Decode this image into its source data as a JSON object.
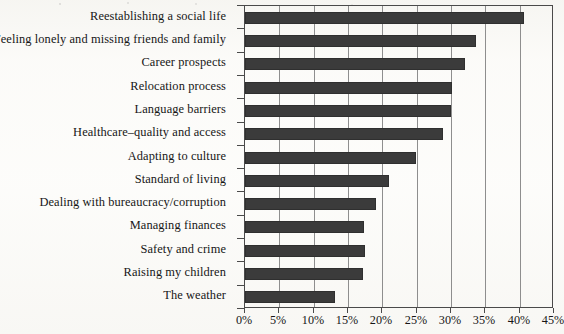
{
  "chart_data": {
    "type": "bar",
    "orientation": "horizontal",
    "title": "",
    "subtitle": "",
    "xlabel": "",
    "ylabel": "",
    "xlim": [
      0,
      45
    ],
    "ylim": null,
    "grid": true,
    "legend": null,
    "legend_position": "none",
    "value_unit": "%",
    "x_ticks": [
      0,
      5,
      10,
      15,
      20,
      25,
      30,
      35,
      40,
      45
    ],
    "x_tick_labels": [
      "0%",
      "5%",
      "10%",
      "15%",
      "20%",
      "25%",
      "30%",
      "35%",
      "40%",
      "45%"
    ],
    "categories": [
      "Reestablishing a social life",
      "Feeling lonely and missing friends and family",
      "Career prospects",
      "Relocation process",
      "Language barriers",
      "Healthcare–quality and access",
      "Adapting to culture",
      "Standard of living",
      "Dealing with bureaucracy/corruption",
      "Managing finances",
      "Safety and crime",
      "Raising my children",
      "The weather"
    ],
    "values": [
      40.7,
      33.7,
      32.1,
      30.2,
      30.0,
      28.9,
      24.9,
      21.0,
      19.1,
      17.3,
      17.5,
      17.2,
      13.1
    ],
    "series": [
      {
        "name": "Share of respondents",
        "values": [
          40.7,
          33.7,
          32.1,
          30.2,
          30.0,
          28.9,
          24.9,
          21.0,
          19.1,
          17.3,
          17.5,
          17.2,
          13.1
        ]
      }
    ],
    "colors": {
      "bar": "#3b3b3b",
      "gridline": "#8e8e8e",
      "axis": "#4a4a4a",
      "text": "#161616",
      "background": "#fdfdfb"
    }
  }
}
